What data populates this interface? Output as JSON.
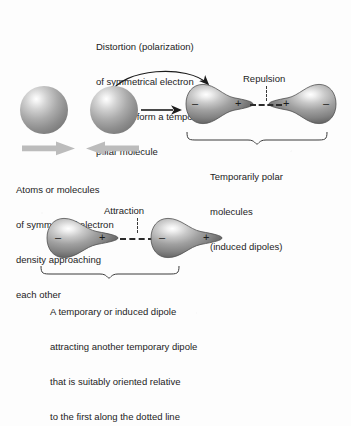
{
  "diagram": {
    "title_visible": false,
    "background_color": "#fdfdfd",
    "ink_color": "#1c1c1c",
    "sphere_colors": {
      "highlight": "#ffffff",
      "body": "#a2a2a2",
      "edge": "#5c5c5c"
    },
    "block_arrow_color": "#b9b9b9"
  },
  "captions": {
    "top": {
      "line1": "Distortion (polarization)",
      "line2": "of symmetrical electron",
      "line3": "clouds to form a temporarily",
      "line4": "polar molecule"
    },
    "left": {
      "line1": "Atoms or molecules",
      "line2": "of symmetrical electron",
      "line3": "density approaching",
      "line4": "each other"
    },
    "right": {
      "line1": "Temporarily polar",
      "line2": "molecules",
      "line3": "(induced dipoles)"
    },
    "bottom": {
      "line1": "A temporary or induced dipole",
      "line2": "attracting another temporary dipole",
      "line3": "that is suitably oriented relative",
      "line4": "to the first along the dotted line"
    }
  },
  "labels": {
    "repulsion": "Repulsion",
    "attraction": "Attraction"
  },
  "charges": {
    "negative": "–",
    "positive": "+"
  },
  "top_row": {
    "sphere_1": {
      "name": "symmetrical atom left",
      "charge": ""
    },
    "sphere_2": {
      "name": "symmetrical atom right",
      "charge": ""
    },
    "dipole_1": {
      "bulb_side": "left",
      "bulb_charge": "–",
      "tip_charge": "+"
    },
    "dipole_2": {
      "bulb_side": "right",
      "bulb_charge": "–",
      "tip_charge": "+"
    },
    "interaction": "Repulsion"
  },
  "bottom_row": {
    "dipole_1": {
      "bulb_side": "left",
      "bulb_charge": "–",
      "tip_charge": "+"
    },
    "dipole_2": {
      "bulb_side": "left",
      "bulb_charge": "–",
      "tip_charge": "+"
    },
    "interaction": "Attraction"
  }
}
